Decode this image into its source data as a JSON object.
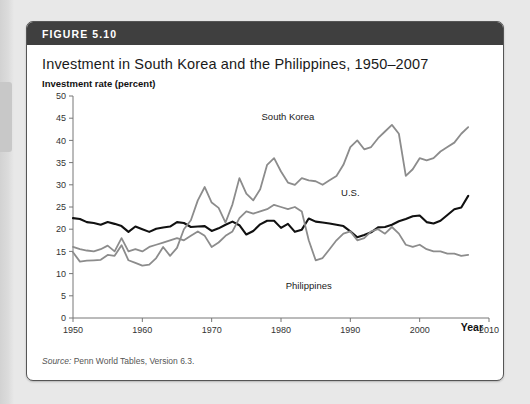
{
  "figure": {
    "number_label": "FIGURE 5.10",
    "title": "Investment in South Korea and the Philippines, 1950–2007",
    "source_prefix": "Source:",
    "source_text": " Penn World Tables, Version 6.3."
  },
  "colors": {
    "header_bar": "#3f3f3f",
    "card_bg": "#ffffff",
    "page_bg": "#e8e8e8",
    "us_line": "#111111",
    "south_korea_line": "#8c8c8c",
    "philippines_line": "#8c8c8c",
    "axis": "#777777",
    "tick_text": "#333333"
  },
  "chart_data": {
    "type": "line",
    "title": "Investment in South Korea and the Philippines, 1950–2007",
    "xlabel": "Year",
    "ylabel": "Investment rate (percent)",
    "xlim": [
      1950,
      2010
    ],
    "ylim": [
      0,
      50
    ],
    "xticks": [
      1950,
      1960,
      1970,
      1980,
      1990,
      2000,
      2010
    ],
    "yticks": [
      0,
      5,
      10,
      15,
      20,
      25,
      30,
      35,
      40,
      45,
      50
    ],
    "grid": false,
    "legend": "inline-annotations",
    "annotations": [
      {
        "text": "South Korea",
        "year": 1981,
        "value": 44.5
      },
      {
        "text": "U.S.",
        "year": 1990,
        "value": 27.5
      },
      {
        "text": "Philippines",
        "year": 1984,
        "value": 6.5
      }
    ],
    "x": [
      1950,
      1951,
      1952,
      1953,
      1954,
      1955,
      1956,
      1957,
      1958,
      1959,
      1960,
      1961,
      1962,
      1963,
      1964,
      1965,
      1966,
      1967,
      1968,
      1969,
      1970,
      1971,
      1972,
      1973,
      1974,
      1975,
      1976,
      1977,
      1978,
      1979,
      1980,
      1981,
      1982,
      1983,
      1984,
      1985,
      1986,
      1987,
      1988,
      1989,
      1990,
      1991,
      1992,
      1993,
      1994,
      1995,
      1996,
      1997,
      1998,
      1999,
      2000,
      2001,
      2002,
      2003,
      2004,
      2005,
      2006,
      2007
    ],
    "series": [
      {
        "name": "U.S.",
        "color": "#111111",
        "values": [
          22.5,
          22.3,
          21.6,
          21.4,
          21.0,
          21.6,
          21.2,
          20.7,
          19.4,
          20.6,
          20.0,
          19.4,
          20.1,
          20.4,
          20.6,
          21.6,
          21.4,
          20.5,
          20.6,
          20.7,
          19.6,
          20.2,
          21.0,
          21.7,
          20.9,
          18.8,
          19.6,
          21.1,
          21.9,
          21.9,
          20.3,
          21.2,
          19.4,
          19.9,
          22.4,
          21.7,
          21.5,
          21.3,
          21.0,
          20.7,
          19.5,
          18.2,
          18.7,
          19.3,
          20.4,
          20.5,
          21.0,
          21.8,
          22.3,
          22.9,
          23.1,
          21.6,
          21.3,
          21.9,
          23.2,
          24.5,
          24.9,
          27.5
        ]
      },
      {
        "name": "South Korea",
        "color": "#8c8c8c",
        "values": [
          14.8,
          12.7,
          12.9,
          13.0,
          13.1,
          14.2,
          14.0,
          16.4,
          13.0,
          12.4,
          11.8,
          12.0,
          13.5,
          16.0,
          14.0,
          15.8,
          20.0,
          22.0,
          26.5,
          29.5,
          26.0,
          24.8,
          21.5,
          25.6,
          31.5,
          28.0,
          26.5,
          29.0,
          34.5,
          36.0,
          33.0,
          30.5,
          30.0,
          31.5,
          31.0,
          30.8,
          30.0,
          31.0,
          32.0,
          34.5,
          38.5,
          40.0,
          38.0,
          38.5,
          40.5,
          42.0,
          43.5,
          41.5,
          32.0,
          33.5,
          36.0,
          35.5,
          36.0,
          37.5,
          38.5,
          39.5,
          41.5,
          43.0
        ]
      },
      {
        "name": "Philippines",
        "color": "#8c8c8c",
        "values": [
          16.0,
          15.5,
          15.2,
          15.0,
          15.5,
          16.3,
          15.0,
          18.0,
          15.0,
          15.5,
          15.0,
          16.0,
          16.5,
          17.0,
          17.5,
          18.0,
          17.5,
          18.5,
          19.5,
          18.5,
          16.0,
          17.0,
          18.5,
          19.5,
          22.5,
          24.0,
          23.5,
          24.0,
          24.5,
          25.5,
          25.0,
          24.5,
          25.0,
          24.0,
          17.5,
          13.0,
          13.5,
          15.5,
          17.5,
          19.0,
          19.5,
          17.5,
          18.0,
          19.5,
          20.0,
          19.0,
          20.5,
          19.0,
          16.5,
          16.0,
          16.5,
          15.5,
          15.0,
          15.0,
          14.5,
          14.5,
          14.0,
          14.2
        ]
      }
    ]
  }
}
